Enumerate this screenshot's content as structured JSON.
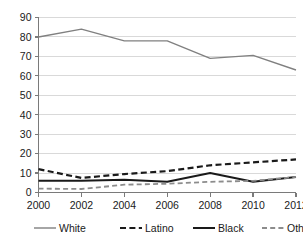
{
  "chart_data": {
    "type": "line",
    "title": "",
    "subtitle": "",
    "xlabel": "",
    "ylabel": "",
    "x": [
      2000,
      2002,
      2004,
      2006,
      2008,
      2010,
      2012
    ],
    "categories": [
      "2000",
      "2002",
      "2004",
      "2006",
      "2008",
      "2010",
      "2012"
    ],
    "xlim": [
      2000,
      2012
    ],
    "ylim": [
      0,
      90
    ],
    "yticks": [
      0,
      10,
      20,
      30,
      40,
      50,
      60,
      70,
      80,
      90
    ],
    "ytick_labels": [
      "0",
      "10",
      "20",
      "30",
      "40",
      "50",
      "60",
      "70",
      "80",
      "90"
    ],
    "xticks": [
      2000,
      2002,
      2004,
      2006,
      2008,
      2010,
      2012
    ],
    "xtick_labels": [
      "2000",
      "2002",
      "2004",
      "2006",
      "2008",
      "2010",
      "2012"
    ],
    "grid": true,
    "grid_axis": "y",
    "grid_color": "#d9d9d9",
    "legend_position": "bottom",
    "series": [
      {
        "name": "White",
        "values": [
          80,
          84,
          78,
          78,
          69,
          70.5,
          63
        ],
        "color": "#808080",
        "style": "solid",
        "width": 1.4
      },
      {
        "name": "Latino",
        "values": [
          12,
          7.5,
          9.5,
          11,
          14,
          15.5,
          17
        ],
        "color": "#1a1a1a",
        "style": "dashed",
        "width": 2.2
      },
      {
        "name": "Black",
        "values": [
          6,
          6,
          6.5,
          5.5,
          10,
          5.5,
          8
        ],
        "color": "#1a1a1a",
        "style": "solid",
        "width": 2.0
      },
      {
        "name": "Other",
        "values": [
          2,
          1.8,
          4,
          4.5,
          5.5,
          6,
          8
        ],
        "color": "#8c8c8c",
        "style": "dashed",
        "width": 1.8
      }
    ]
  },
  "legend": {
    "items": [
      {
        "label": "White",
        "color": "#808080",
        "style": "solid"
      },
      {
        "label": "Latino",
        "color": "#1a1a1a",
        "style": "dashed"
      },
      {
        "label": "Black",
        "color": "#1a1a1a",
        "style": "solid"
      },
      {
        "label": "Other",
        "color": "#8c8c8c",
        "style": "dashed"
      }
    ]
  },
  "axes": {
    "axis_color": "#7a7a7a",
    "tick_color": "#7a7a7a"
  }
}
